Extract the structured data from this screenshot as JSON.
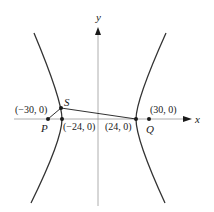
{
  "diagram": {
    "type": "hyperbola",
    "axes": {
      "x_label": "x",
      "y_label": "y"
    },
    "points": [
      {
        "name": "P",
        "coord_label": "(−30, 0)"
      },
      {
        "name": "Q",
        "coord_label": "(30, 0)"
      },
      {
        "name": "S",
        "coord_label": ""
      },
      {
        "name": "left-vertex",
        "coord_label": "(−24, 0)"
      },
      {
        "name": "right-vertex",
        "coord_label": "(24, 0)"
      }
    ],
    "segments": [
      "P-S",
      "S-right-vertex",
      "right-vertex-Q"
    ],
    "colors": {
      "curve": "#333333",
      "axis": "#888888",
      "ink": "#1a1a1a"
    }
  }
}
